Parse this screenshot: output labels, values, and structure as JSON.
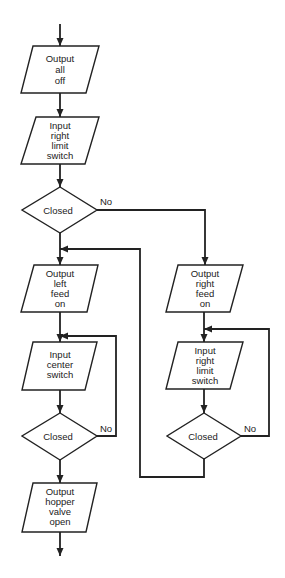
{
  "diagram": {
    "type": "flowchart",
    "colors": {
      "line": "#222222",
      "background": "#ffffff"
    },
    "nodes": [
      {
        "id": "n1",
        "shape": "parallelogram",
        "lines": [
          "Output",
          "all",
          "off"
        ]
      },
      {
        "id": "n2",
        "shape": "parallelogram",
        "lines": [
          "Input",
          "right",
          "limit",
          "switch"
        ]
      },
      {
        "id": "d1",
        "shape": "diamond",
        "label": "Closed",
        "no_label": "No"
      },
      {
        "id": "n3",
        "shape": "parallelogram",
        "lines": [
          "Output",
          "left",
          "feed",
          "on"
        ]
      },
      {
        "id": "n4",
        "shape": "parallelogram",
        "lines": [
          "Input",
          "center",
          "switch"
        ]
      },
      {
        "id": "d2",
        "shape": "diamond",
        "label": "Closed",
        "no_label": "No"
      },
      {
        "id": "n5",
        "shape": "parallelogram",
        "lines": [
          "Output",
          "hopper",
          "valve",
          "open"
        ]
      },
      {
        "id": "r1",
        "shape": "parallelogram",
        "lines": [
          "Output",
          "right",
          "feed",
          "on"
        ]
      },
      {
        "id": "r2",
        "shape": "parallelogram",
        "lines": [
          "Input",
          "right",
          "limit",
          "switch"
        ]
      },
      {
        "id": "d3",
        "shape": "diamond",
        "label": "Closed",
        "no_label": "No"
      }
    ],
    "edges": [
      {
        "from": "start",
        "to": "n1"
      },
      {
        "from": "n1",
        "to": "n2"
      },
      {
        "from": "n2",
        "to": "d1"
      },
      {
        "from": "d1",
        "to": "n3",
        "label": "yes"
      },
      {
        "from": "d1",
        "to": "r1",
        "label": "No"
      },
      {
        "from": "n3",
        "to": "n4"
      },
      {
        "from": "n4",
        "to": "d2"
      },
      {
        "from": "d2",
        "to": "n4",
        "label": "No"
      },
      {
        "from": "d2",
        "to": "n5",
        "label": "yes"
      },
      {
        "from": "n5",
        "to": "end"
      },
      {
        "from": "r1",
        "to": "r2"
      },
      {
        "from": "r2",
        "to": "d3"
      },
      {
        "from": "d3",
        "to": "r2",
        "label": "No"
      },
      {
        "from": "d3",
        "to": "n3",
        "label": "yes"
      }
    ]
  }
}
